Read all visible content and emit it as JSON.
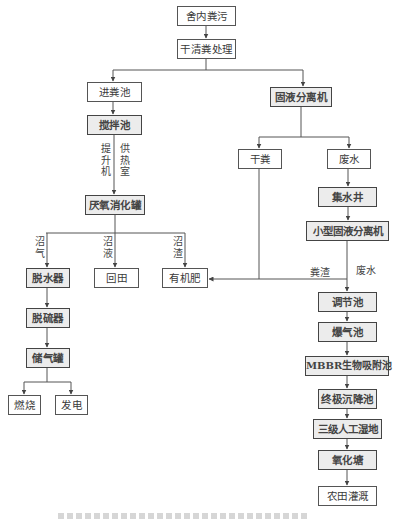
{
  "diagram": {
    "title": "",
    "nodes": {
      "manure_in_house": {
        "label": "舍内粪污",
        "shaded": false
      },
      "dry_cleaning": {
        "label": "干清粪处理",
        "shaded": false
      },
      "feed_pit": {
        "label": "进粪池",
        "shaded": false
      },
      "stirring_tank": {
        "label": "搅拌池",
        "shaded": true
      },
      "anaerobic_digester": {
        "label": "厌氧消化罐",
        "shaded": true
      },
      "dehydrator": {
        "label": "脱水器",
        "shaded": true
      },
      "desulfurizer": {
        "label": "脱硫器",
        "shaded": true
      },
      "gas_tank": {
        "label": "储气罐",
        "shaded": true
      },
      "combustion": {
        "label": "燃烧",
        "shaded": false
      },
      "power_generation": {
        "label": "发电",
        "shaded": false
      },
      "return_field": {
        "label": "回田",
        "shaded": false
      },
      "organic_fertilizer": {
        "label": "有机肥",
        "shaded": false
      },
      "solid_liquid_separator": {
        "label": "固液分离机",
        "shaded": true
      },
      "dry_manure": {
        "label": "干粪",
        "shaded": false
      },
      "wastewater": {
        "label": "废水",
        "shaded": false
      },
      "collection_well": {
        "label": "集水井",
        "shaded": true
      },
      "small_separator": {
        "label": "小型固液分离机",
        "shaded": true
      },
      "regulating_tank": {
        "label": "调节池",
        "shaded": true
      },
      "aeration_tank": {
        "label": "爆气池",
        "shaded": true
      },
      "mbbr_tank": {
        "label": "MBBR生物吸附池",
        "shaded": true
      },
      "final_settling": {
        "label": "终极沉降池",
        "shaded": true
      },
      "wetland": {
        "label": "三级人工湿地",
        "shaded": true
      },
      "oxidation_pond": {
        "label": "氧化塘",
        "shaded": true
      },
      "farmland_irrigation": {
        "label": "农田灌溉",
        "shaded": false
      }
    },
    "edge_labels": {
      "lift_machine": "提升机",
      "heating_room": "供热室",
      "biogas": "沼气",
      "biogas_slurry": "沼液",
      "biogas_residue": "沼渣",
      "manure_residue": "粪渣",
      "wastewater": "废水"
    },
    "colors": {
      "line": "#555555",
      "shaded_fill": "#ececec",
      "box_border": "#555555"
    }
  }
}
